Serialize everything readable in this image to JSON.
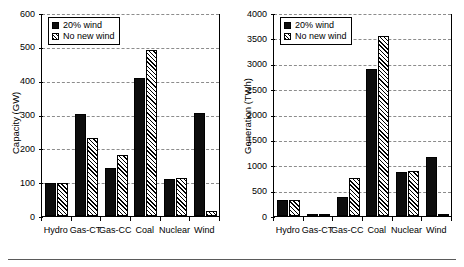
{
  "figure": {
    "panels": [
      "capacity",
      "generation"
    ],
    "legend_entries": [
      {
        "key": "wind20",
        "label": "20% wind",
        "pattern": "solid",
        "color": "#0d0d0d"
      },
      {
        "key": "nonew",
        "label": "No new wind",
        "pattern": "hatch",
        "color": "#ffffff"
      }
    ],
    "footer_rule": true
  },
  "chart_data": [
    {
      "id": "capacity",
      "type": "bar",
      "title": "",
      "xlabel": "",
      "ylabel": "Capacity (GW)",
      "ylim": [
        0,
        600
      ],
      "ytick_step": 100,
      "yticks": [
        0,
        100,
        200,
        300,
        400,
        500,
        600
      ],
      "ytick_labels": [
        "0",
        "100",
        "200",
        "300",
        "400",
        "500",
        "600"
      ],
      "grid": true,
      "grid_axis": "y",
      "legend_position": "top-left",
      "categories": [
        "Hydro",
        "Gas-CT",
        "Gas-CC",
        "Coal",
        "Nuclear",
        "Wind"
      ],
      "series": [
        {
          "name": "20% wind",
          "pattern": "solid",
          "values": [
            97,
            303,
            143,
            407,
            109,
            305
          ]
        },
        {
          "name": "No new wind",
          "pattern": "hatch",
          "values": [
            99,
            232,
            179,
            490,
            111,
            15
          ]
        }
      ]
    },
    {
      "id": "generation",
      "type": "bar",
      "title": "",
      "xlabel": "",
      "ylabel": "Generation (TWh)",
      "ylim": [
        0,
        4000
      ],
      "ytick_step": 500,
      "yticks": [
        0,
        500,
        1000,
        1500,
        2000,
        2500,
        3000,
        3500,
        4000
      ],
      "ytick_labels": [
        "0",
        "500",
        "1000",
        "1500",
        "2000",
        "2500",
        "3000",
        "3500",
        "4000"
      ],
      "grid": true,
      "grid_axis": "y",
      "legend_position": "top-left",
      "categories": [
        "Hydro",
        "Gas-CT",
        "Gas-CC",
        "Coal",
        "Nuclear",
        "Wind"
      ],
      "series": [
        {
          "name": "20% wind",
          "pattern": "solid",
          "values": [
            310,
            33,
            370,
            2900,
            860,
            1170
          ]
        },
        {
          "name": "No new wind",
          "pattern": "hatch",
          "values": [
            310,
            25,
            745,
            3550,
            880,
            20
          ]
        }
      ]
    }
  ]
}
